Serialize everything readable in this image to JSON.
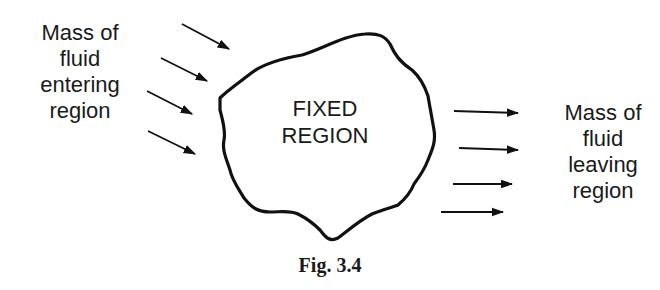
{
  "figure": {
    "caption": "Fig. 3.4",
    "region_label": [
      "FIXED",
      "REGION"
    ],
    "inflow_label": [
      "Mass of",
      "fluid",
      "entering",
      "region"
    ],
    "outflow_label": [
      "Mass of",
      "fluid",
      "leaving",
      "region"
    ],
    "inflow_arrow_count": 4,
    "outflow_arrow_count": 4,
    "colors": {
      "stroke": "#111111",
      "text": "#1a1a1a",
      "background": "#ffffff"
    }
  }
}
